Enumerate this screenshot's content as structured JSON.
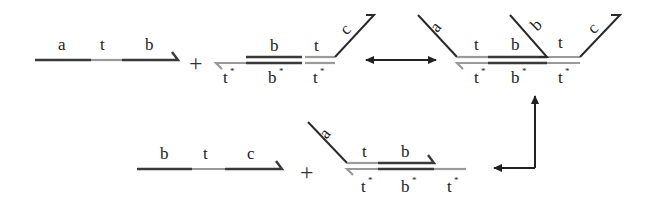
{
  "diagram": {
    "type": "DNA strand displacement reaction scheme",
    "operators": {
      "plus_1": "+",
      "plus_2": "+"
    },
    "strand_atb": {
      "labels": [
        "a",
        "t",
        "b"
      ]
    },
    "complex_1": {
      "top_labels": [
        "b",
        "t"
      ],
      "arm_label": "c",
      "bottom_labels": [
        "t",
        "b",
        "t"
      ],
      "bottom_star": "*"
    },
    "complex_2": {
      "arm_labels": [
        "a",
        "b",
        "c"
      ],
      "top_labels": [
        "t",
        "b",
        "t"
      ],
      "bottom_labels": [
        "t",
        "b",
        "t"
      ],
      "bottom_star": "*"
    },
    "strand_btc": {
      "labels": [
        "b",
        "t",
        "c"
      ]
    },
    "complex_3": {
      "arm_label": "a",
      "top_labels": [
        "t",
        "b"
      ],
      "bottom_labels": [
        "t",
        "b",
        "t"
      ],
      "bottom_star": "*"
    },
    "arrows": [
      {
        "name": "reversible-arrow",
        "from": "complex_1",
        "to": "complex_2",
        "direction": "bidirectional"
      },
      {
        "name": "output-arrow",
        "from": "complex_2",
        "to": "strand_btc + complex_3",
        "direction": "up-then-left"
      }
    ],
    "colors": {
      "domain_dark": "#3a3a3a",
      "domain_light": "#9a9a9a",
      "background": "#ffffff"
    }
  }
}
